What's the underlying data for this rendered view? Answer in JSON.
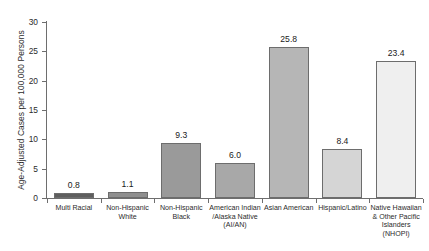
{
  "chart_data": {
    "type": "bar",
    "title": "",
    "xlabel": "",
    "ylabel": "Age-Adjusted Cases per 100,000 Persons",
    "ylim": [
      0,
      30
    ],
    "yticks": [
      0,
      5,
      10,
      15,
      20,
      25,
      30
    ],
    "grid": false,
    "legend": false,
    "categories": [
      "Multi Racial",
      "Non-Hispanic White",
      "Non-Hispanic Black",
      "American Indian /Alaska Native (AI/AN)",
      "Asian American",
      "Hispanic/Latino",
      "Native Hawaiian & Other Pacific Islanders (NHOPI)"
    ],
    "category_lines": [
      [
        "Multi Racial"
      ],
      [
        "Non-Hispanic",
        "White"
      ],
      [
        "Non-Hispanic",
        "Black"
      ],
      [
        "American Indian",
        "/Alaska Native",
        "(AI/AN)"
      ],
      [
        "Asian American"
      ],
      [
        "Hispanic/Latino"
      ],
      [
        "Native Hawaiian",
        "& Other Pacific",
        "Islanders",
        "(NHOPI)"
      ]
    ],
    "values": [
      0.8,
      1.1,
      9.3,
      6.0,
      25.8,
      8.4,
      23.4
    ],
    "value_labels": [
      "0.8",
      "1.1",
      "9.3",
      "6.0",
      "25.8",
      "8.4",
      "23.4"
    ],
    "bar_colors": [
      "#5e5e5e",
      "#8f8f8f",
      "#9a9a9a",
      "#a8a8a8",
      "#b6b6b6",
      "#d5d5d5",
      "#efefef"
    ],
    "bar_edge_color": "#6d6d6d",
    "axis_color": "#6e6e6e",
    "text_color": "#2b2b2b"
  },
  "ytick_labels": [
    "0",
    "5",
    "10",
    "15",
    "20",
    "25",
    "30"
  ]
}
